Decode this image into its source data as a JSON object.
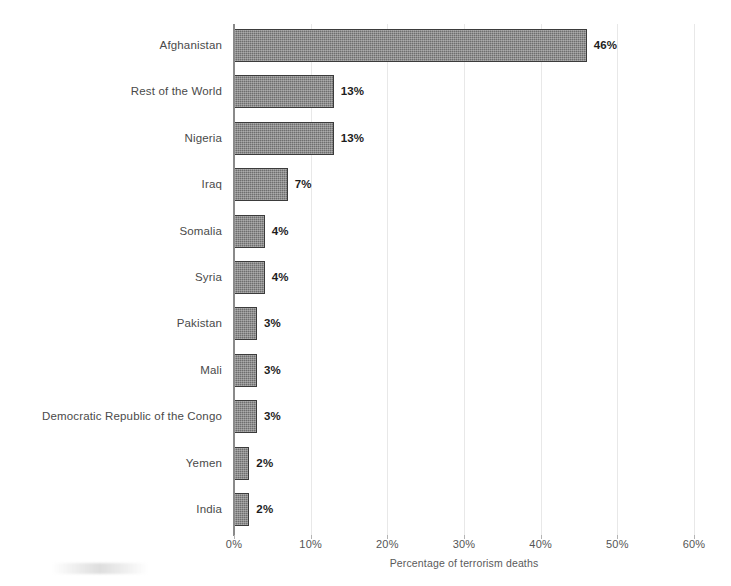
{
  "chart_data": {
    "type": "bar",
    "orientation": "horizontal",
    "title": "",
    "xlabel": "Percentage of terrorism deaths",
    "ylabel": "",
    "xlim": [
      0,
      60
    ],
    "xtick_labels": [
      "0%",
      "10%",
      "20%",
      "30%",
      "40%",
      "50%",
      "60%"
    ],
    "xticks": [
      0,
      10,
      20,
      30,
      40,
      50,
      60
    ],
    "grid": true,
    "legend": false,
    "value_suffix": "%",
    "categories": [
      "Afghanistan",
      "Rest of the World",
      "Nigeria",
      "Iraq",
      "Somalia",
      "Syria",
      "Pakistan",
      "Mali",
      "Democratic Republic of the Congo",
      "Yemen",
      "India"
    ],
    "values": [
      46,
      13,
      13,
      7,
      4,
      4,
      3,
      3,
      3,
      2,
      2
    ],
    "data_labels": [
      "46%",
      "13%",
      "13%",
      "7%",
      "4%",
      "4%",
      "3%",
      "3%",
      "3%",
      "2%",
      "2%"
    ],
    "bar_fill_color": "#6e6e6e",
    "bar_border_color": "#3b3b3b",
    "gridline_color": "#e8e8e8",
    "axis_color": "#8a8a8a",
    "label_color": "#4a4a4a",
    "value_color": "#1d1d1d"
  }
}
